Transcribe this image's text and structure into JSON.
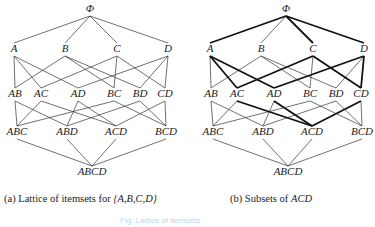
{
  "figure": {
    "panels": [
      {
        "id": "a",
        "caption_prefix": "(a) Lattice of itemsets for ",
        "caption_italic": "{A,B,C,D}",
        "offset_x": 0,
        "highlight": []
      },
      {
        "id": "b",
        "caption_prefix": "(b) Subsets of ",
        "caption_italic": "ACD",
        "offset_x": 196,
        "highlight": [
          "ACD-AC",
          "ACD-AD",
          "ACD-CD",
          "AC-A",
          "AC-C",
          "AD-A",
          "AD-D",
          "CD-C",
          "CD-D",
          "A-PHI",
          "C-PHI",
          "D-PHI"
        ]
      }
    ],
    "nodes": {
      "PHI": {
        "label": "Φ",
        "x": 90,
        "y": 12
      },
      "A": {
        "label": "A",
        "x": 14,
        "y": 52
      },
      "B": {
        "label": "B",
        "x": 65,
        "y": 52
      },
      "C": {
        "label": "C",
        "x": 117,
        "y": 52
      },
      "D": {
        "label": "D",
        "x": 168,
        "y": 52
      },
      "AB": {
        "label": "AB",
        "x": 15,
        "y": 97
      },
      "AC": {
        "label": "AC",
        "x": 41,
        "y": 97
      },
      "AD": {
        "label": "AD",
        "x": 78,
        "y": 97
      },
      "BC": {
        "label": "BC",
        "x": 114,
        "y": 97
      },
      "BD": {
        "label": "BD",
        "x": 140,
        "y": 97
      },
      "CD": {
        "label": "CD",
        "x": 165,
        "y": 97
      },
      "ABC": {
        "label": "ABC",
        "x": 17,
        "y": 135
      },
      "ABD": {
        "label": "ABD",
        "x": 67,
        "y": 135
      },
      "ACD": {
        "label": "ACD",
        "x": 116,
        "y": 135
      },
      "BCD": {
        "label": "BCD",
        "x": 166,
        "y": 135
      },
      "ABCD": {
        "label": "ABCD",
        "x": 92,
        "y": 175
      }
    },
    "edges": [
      [
        "A",
        "PHI"
      ],
      [
        "B",
        "PHI"
      ],
      [
        "C",
        "PHI"
      ],
      [
        "D",
        "PHI"
      ],
      [
        "AB",
        "A"
      ],
      [
        "AB",
        "B"
      ],
      [
        "AC",
        "A"
      ],
      [
        "AC",
        "C"
      ],
      [
        "AD",
        "A"
      ],
      [
        "AD",
        "D"
      ],
      [
        "BC",
        "B"
      ],
      [
        "BC",
        "C"
      ],
      [
        "BD",
        "B"
      ],
      [
        "BD",
        "D"
      ],
      [
        "CD",
        "C"
      ],
      [
        "CD",
        "D"
      ],
      [
        "ABC",
        "AB"
      ],
      [
        "ABC",
        "AC"
      ],
      [
        "ABC",
        "BC"
      ],
      [
        "ABD",
        "AB"
      ],
      [
        "ABD",
        "AD"
      ],
      [
        "ABD",
        "BD"
      ],
      [
        "ACD",
        "AC"
      ],
      [
        "ACD",
        "AD"
      ],
      [
        "ACD",
        "CD"
      ],
      [
        "BCD",
        "BC"
      ],
      [
        "BCD",
        "BD"
      ],
      [
        "BCD",
        "CD"
      ],
      [
        "ABCD",
        "ABC"
      ],
      [
        "ABCD",
        "ABD"
      ],
      [
        "ABCD",
        "ACD"
      ],
      [
        "ABCD",
        "BCD"
      ]
    ],
    "footer_faint_text": "Fig. Lattice of itemsets"
  }
}
